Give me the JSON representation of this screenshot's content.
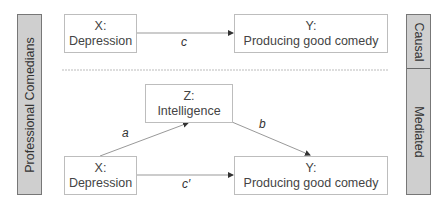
{
  "sidebar_left": {
    "label": "Professional Comedians"
  },
  "sidebar_right": {
    "segments": [
      {
        "label": "Causal"
      },
      {
        "label": "Mediated"
      }
    ]
  },
  "causal_model": {
    "x_node": {
      "var": "X:",
      "name": "Depression"
    },
    "y_node": {
      "var": "Y:",
      "name": "Producing good comedy"
    },
    "path_label": "c"
  },
  "mediated_model": {
    "x_node": {
      "var": "X:",
      "name": "Depression"
    },
    "z_node": {
      "var": "Z:",
      "name": "Intelligence"
    },
    "y_node": {
      "var": "Y:",
      "name": "Producing good comedy"
    },
    "path_a": "a",
    "path_b": "b",
    "path_c_prime": "c′"
  },
  "colors": {
    "sidebar_fill": "#cfcfcf",
    "box_border": "#bdbdbd",
    "line": "#999999"
  }
}
